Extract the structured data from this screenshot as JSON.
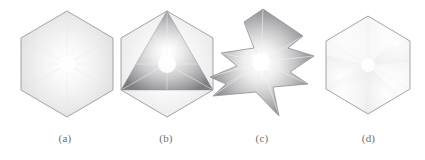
{
  "figure": {
    "background_color": "#ffffff",
    "outline_color": "#9a9a9e",
    "label_color": "#6e6e72",
    "panels": [
      {
        "id": "a",
        "label": "(a)",
        "shape_name": "hexagon",
        "description": "Regular hexagon with flat vertical left and right edges, pointed top and bottom vertex, filled with a pale radial gradient emanating from the centre and faint radial spoke lines to each vertex.",
        "vertices": [
          [
            67,
            11
          ],
          [
            113,
            38
          ],
          [
            113,
            90
          ],
          [
            67,
            117
          ],
          [
            21,
            90
          ],
          [
            21,
            38
          ]
        ],
        "center": [
          67,
          64
        ],
        "fill_center_color": "#ffffff",
        "fill_edge_color": "#dcdcdd",
        "shading": "radial-light"
      },
      {
        "id": "b",
        "label": "(b)",
        "shape_name": "hexagon-with-inscribed-triangle",
        "description": "Same hexagon outline as (a) with an inscribed triangle whose apex is the top vertex and whose base corners are the lower-left and lower-right vertices; the triangle is strongly Gouraud shaded dark grey at its corners and bright white at the centre.",
        "hexagon_vertices": [
          [
            63,
            11
          ],
          [
            109,
            38
          ],
          [
            109,
            90
          ],
          [
            63,
            117
          ],
          [
            17,
            90
          ],
          [
            17,
            38
          ]
        ],
        "triangle_vertices": [
          [
            63,
            11
          ],
          [
            109,
            90
          ],
          [
            17,
            90
          ]
        ],
        "center": [
          63,
          64
        ],
        "fill_center_color": "#ffffff",
        "fill_edge_color": "#808084",
        "shading": "radial-dark"
      },
      {
        "id": "c",
        "label": "(c)",
        "shape_name": "non-convex-star-polygon",
        "description": "Concave pinwheel / star shaped polygon derived from the hexagon by pushing three alternating edges inward, producing reflex notches on the upper-left, right and bottom; shaded radially with dark grey corners and a bright white centre.",
        "vertices": [
          [
            59,
            9
          ],
          [
            99,
            36
          ],
          [
            84,
            48
          ],
          [
            110,
            56
          ],
          [
            86,
            72
          ],
          [
            104,
            84
          ],
          [
            69,
            87
          ],
          [
            75,
            116
          ],
          [
            52,
            92
          ],
          [
            9,
            96
          ],
          [
            22,
            84
          ],
          [
            6,
            77
          ],
          [
            33,
            66
          ],
          [
            17,
            53
          ],
          [
            50,
            48
          ],
          [
            40,
            22
          ]
        ],
        "center": [
          57,
          62
        ],
        "fill_center_color": "#ffffff",
        "fill_edge_color": "#7f7f83",
        "shading": "radial-dark"
      },
      {
        "id": "d",
        "label": "(d)",
        "shape_name": "hexagon-sectored",
        "description": "Regular hexagon of the same orientation as (a) but slightly smaller, filled with soft pie-wedge sectors radiating from the centre, each sector a slightly different pale grey tone.",
        "vertices": [
          [
            56,
            16
          ],
          [
            98,
            41
          ],
          [
            98,
            89
          ],
          [
            56,
            114
          ],
          [
            14,
            89
          ],
          [
            14,
            41
          ]
        ],
        "center": [
          56,
          65
        ],
        "fill_center_color": "#ffffff",
        "fill_edge_color": "#e2e2e3",
        "shading": "sectored-light"
      }
    ]
  }
}
